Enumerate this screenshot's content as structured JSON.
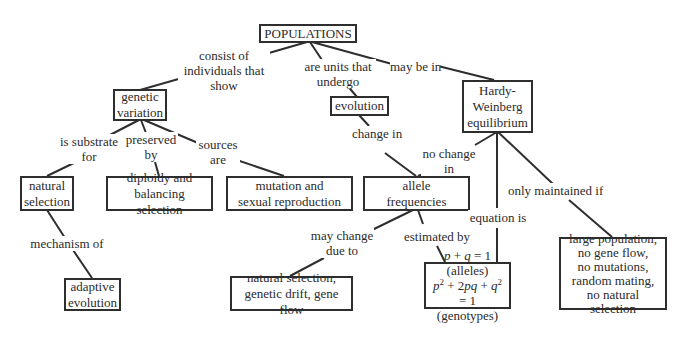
{
  "diagram": {
    "type": "concept-map",
    "nodes": {
      "populations": {
        "lines": [
          "POPULATIONS"
        ]
      },
      "genetic_variation": {
        "lines": [
          "genetic",
          "variation"
        ]
      },
      "evolution": {
        "lines": [
          "evolution"
        ]
      },
      "hardy_weinberg": {
        "lines": [
          "Hardy-",
          "Weinberg",
          "equilibrium"
        ]
      },
      "natural_selection": {
        "lines": [
          "natural",
          "selection"
        ]
      },
      "diploidy": {
        "lines": [
          "diploidy and",
          "balancing selection"
        ]
      },
      "mutation": {
        "lines": [
          "mutation and",
          "sexual reproduction"
        ]
      },
      "allele_frequencies": {
        "lines": [
          "allele",
          "frequencies"
        ]
      },
      "adaptive_evolution": {
        "lines": [
          "adaptive",
          "evolution"
        ]
      },
      "change_causes": {
        "lines": [
          "natural selection,",
          "genetic drift, gene flow"
        ]
      },
      "equations": {
        "lines": [
          "p + q = 1 (alleles)",
          "p2 + 2pq + q2 = 1",
          "(genotypes)"
        ]
      },
      "hw_conditions": {
        "lines": [
          "large population,",
          "no gene flow,",
          "no mutations,",
          "random mating,",
          "no natural selection"
        ]
      }
    },
    "links": {
      "consist_of": {
        "lines": [
          "consist of",
          "individuals that",
          "show"
        ],
        "from": "populations",
        "to": "genetic_variation"
      },
      "units_undergo": {
        "lines": [
          "are units that",
          "undergo"
        ],
        "from": "populations",
        "to": "evolution"
      },
      "may_be_in": {
        "lines": [
          "may be in"
        ],
        "from": "populations",
        "to": "hardy_weinberg"
      },
      "substrate_for": {
        "lines": [
          "is substrate",
          "for"
        ],
        "from": "genetic_variation",
        "to": "natural_selection"
      },
      "preserved_by": {
        "lines": [
          "preserved",
          "by"
        ],
        "from": "genetic_variation",
        "to": "diploidy"
      },
      "sources_are": {
        "lines": [
          "sources",
          "are"
        ],
        "from": "genetic_variation",
        "to": "mutation"
      },
      "mechanism_of": {
        "lines": [
          "mechanism of"
        ],
        "from": "natural_selection",
        "to": "adaptive_evolution"
      },
      "change_in": {
        "lines": [
          "change in"
        ],
        "from": "evolution",
        "to": "allele_frequencies"
      },
      "no_change_in": {
        "lines": [
          "no change",
          "in"
        ],
        "from": "hardy_weinberg",
        "to": "allele_frequencies"
      },
      "equation_is": {
        "lines": [
          "equation is"
        ],
        "from": "hardy_weinberg",
        "to": "equations"
      },
      "only_maintained_if": {
        "lines": [
          "only maintained if"
        ],
        "from": "hardy_weinberg",
        "to": "hw_conditions"
      },
      "may_change_due_to": {
        "lines": [
          "may change",
          "due to"
        ],
        "from": "allele_frequencies",
        "to": "change_causes"
      },
      "estimated_by": {
        "lines": [
          "estimated by"
        ],
        "from": "allele_frequencies",
        "to": "equations"
      }
    }
  },
  "colors": {
    "line": "#2e2e2e",
    "text": "#2b2b2b",
    "background": "#ffffff"
  }
}
